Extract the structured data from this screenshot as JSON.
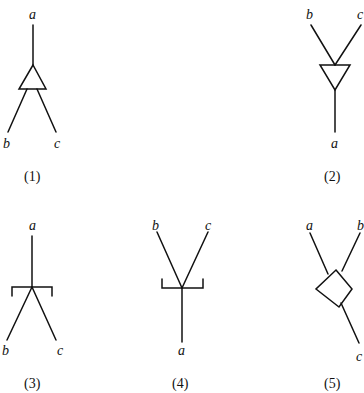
{
  "diagrams": [
    {
      "id": "1",
      "caption": "(1)",
      "top_label": "a",
      "bottom_left_label": "b",
      "bottom_right_label": "c",
      "shape": "triangle-up"
    },
    {
      "id": "2",
      "caption": "(2)",
      "top_left_label": "b",
      "top_right_label": "c",
      "bottom_label": "a",
      "shape": "triangle-down"
    },
    {
      "id": "3",
      "caption": "(3)",
      "top_label": "a",
      "bottom_left_label": "b",
      "bottom_right_label": "c",
      "shape": "bracket-down"
    },
    {
      "id": "4",
      "caption": "(4)",
      "top_left_label": "b",
      "top_right_label": "c",
      "bottom_label": "a",
      "shape": "bracket-up"
    },
    {
      "id": "5",
      "caption": "(5)",
      "top_left_label": "a",
      "top_right_label": "b",
      "bottom_label": "c",
      "shape": "diamond"
    }
  ]
}
